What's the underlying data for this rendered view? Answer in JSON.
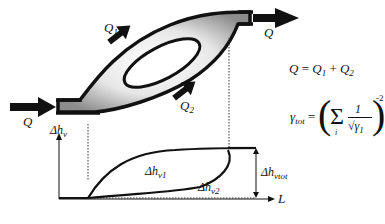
{
  "diagram": {
    "type": "pipe-branch-flow-schematic",
    "flow_labels": {
      "inlet": "Q",
      "outlet": "Q",
      "branch_1": "Q",
      "branch_1_sub": "1",
      "branch_2": "Q",
      "branch_2_sub": "2"
    },
    "equations": {
      "flow_sum": {
        "lhs": "Q",
        "eq": "=",
        "t1": "Q",
        "t1_sub": "1",
        "plus": "+",
        "t2": "Q",
        "t2_sub": "2"
      },
      "gamma_tot": {
        "lhs": "γ",
        "lhs_sub": "tot",
        "eq": "=",
        "sum": "Σ",
        "sum_index": "i",
        "numer": "1",
        "denom": "√γ",
        "denom_sub": "1",
        "exponent": "-2"
      }
    },
    "plot": {
      "y_axis_label": "Δh",
      "y_axis_sub": "v",
      "x_axis_label": "L",
      "curve_1_label": "Δh",
      "curve_1_sub": "v1",
      "curve_2_label": "Δh",
      "curve_2_sub": "v2",
      "total_label": "Δh",
      "total_sub": "vtot"
    },
    "colors": {
      "stroke": "#111111",
      "fill_light": "#f4f4f4",
      "fill_dark": "#9a9a9a"
    }
  }
}
